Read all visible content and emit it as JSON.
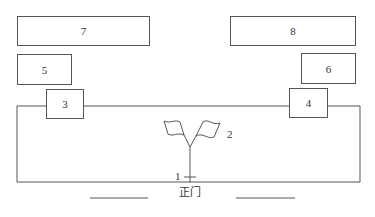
{
  "diagram": {
    "type": "site layout",
    "boxes": [
      {
        "id": "7",
        "label": "7"
      },
      {
        "id": "8",
        "label": "8"
      },
      {
        "id": "5",
        "label": "5"
      },
      {
        "id": "6",
        "label": "6"
      },
      {
        "id": "3",
        "label": "3"
      },
      {
        "id": "4",
        "label": "4"
      }
    ],
    "markers": {
      "flagpole": "1",
      "flags": "2"
    },
    "gate_label": "正门",
    "colors": {
      "line": "#555555",
      "text": "#333333",
      "background": "#ffffff"
    }
  }
}
